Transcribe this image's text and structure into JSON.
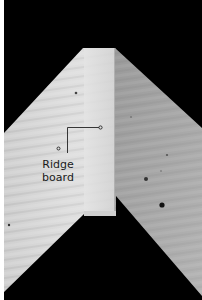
{
  "figure": {
    "colors": {
      "background": "#000000",
      "margin": "#ffffff",
      "left_rafter": "#d6d6d6",
      "ridge_board_face": "#dcdcdc",
      "right_rafter": "#a8a8a8",
      "leader_line": "#222222"
    },
    "annotations": [
      {
        "label_line1": "Ridge",
        "label_line2": "board",
        "target": "ridge-board"
      }
    ]
  }
}
